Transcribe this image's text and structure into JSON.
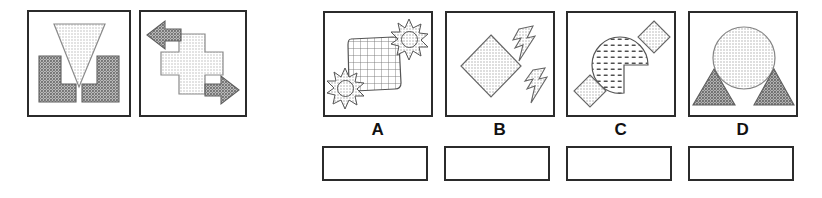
{
  "puzzle": {
    "type": "visual-analogy-matrix",
    "stimulus_panels": [
      {
        "name": "panel-1",
        "shapes": [
          {
            "shape": "triangle-down",
            "fill": "light-stipple",
            "position": "center-top"
          },
          {
            "shape": "l-block",
            "fill": "dark-stipple",
            "position": "lower-left"
          },
          {
            "shape": "l-block-mirrored",
            "fill": "dark-stipple",
            "position": "lower-right"
          }
        ]
      },
      {
        "name": "panel-2",
        "shapes": [
          {
            "shape": "cross-plus",
            "fill": "light-stipple",
            "position": "center"
          },
          {
            "shape": "arrow-left",
            "fill": "dark-stipple",
            "position": "upper-left"
          },
          {
            "shape": "arrow-right",
            "fill": "dark-stipple",
            "position": "lower-right"
          }
        ]
      }
    ],
    "options": [
      {
        "label": "A",
        "shapes": [
          {
            "shape": "rounded-square-grid",
            "fill": "grid-mesh",
            "position": "center"
          },
          {
            "shape": "starburst",
            "fill": "light-stipple",
            "position": "upper-right"
          },
          {
            "shape": "starburst",
            "fill": "light-stipple",
            "position": "lower-left"
          }
        ]
      },
      {
        "label": "B",
        "shapes": [
          {
            "shape": "diamond",
            "fill": "light-stipple",
            "position": "center-left"
          },
          {
            "shape": "lightning-bolt",
            "fill": "light-stipple",
            "position": "upper-right"
          },
          {
            "shape": "lightning-bolt",
            "fill": "light-stipple",
            "position": "lower-right"
          }
        ]
      },
      {
        "label": "C",
        "shapes": [
          {
            "shape": "pac-man-circle",
            "fill": "dash-pattern",
            "position": "center"
          },
          {
            "shape": "small-diamond",
            "fill": "light-stipple",
            "position": "upper-right"
          },
          {
            "shape": "small-diamond",
            "fill": "light-stipple",
            "position": "lower-left"
          }
        ]
      },
      {
        "label": "D",
        "shapes": [
          {
            "shape": "circle",
            "fill": "light-stipple",
            "position": "center-top"
          },
          {
            "shape": "triangle-up",
            "fill": "dark-stipple",
            "position": "lower-left"
          },
          {
            "shape": "triangle-up",
            "fill": "dark-stipple",
            "position": "lower-right"
          }
        ]
      }
    ],
    "answer_boxes": [
      {
        "for_option": "A",
        "value": ""
      },
      {
        "for_option": "B",
        "value": ""
      },
      {
        "for_option": "C",
        "value": ""
      },
      {
        "for_option": "D",
        "value": ""
      }
    ]
  },
  "colors": {
    "outline": "#2b2b2b",
    "shape_outline": "#555555",
    "light_fill": "#d4d4d4",
    "dark_fill": "#8f8f8f",
    "background": "#ffffff",
    "label_text": "#111111"
  }
}
